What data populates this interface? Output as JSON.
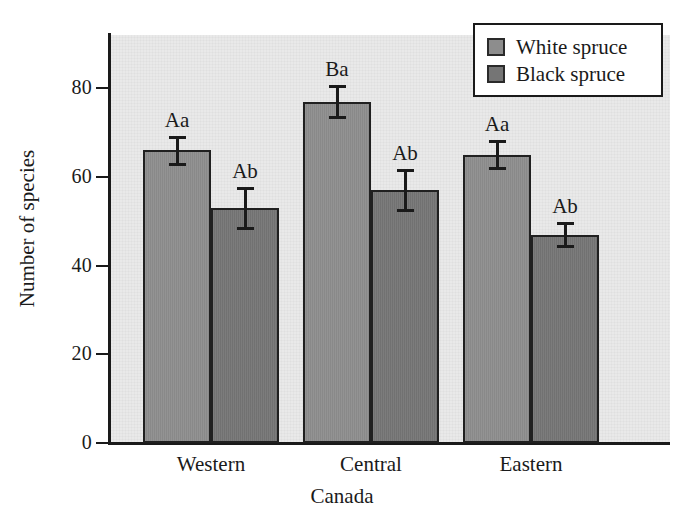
{
  "chart_data": {
    "type": "bar",
    "title": "",
    "subtitle": "",
    "xlabel": "Canada",
    "ylabel": "Number of species",
    "categories": [
      "Western",
      "Central",
      "Eastern"
    ],
    "ylim": [
      0,
      92
    ],
    "yticks": [
      0,
      20,
      40,
      60,
      80
    ],
    "ytick_labels": [
      "0",
      "20",
      "40",
      "60",
      "80"
    ],
    "grid": false,
    "legend_position": "top-right",
    "series": [
      {
        "name": "White spruce",
        "color": "#8d8d8d",
        "values": [
          66,
          77,
          65
        ],
        "errors": [
          3.0,
          3.5,
          3.0
        ],
        "annotations": [
          "Aa",
          "Ba",
          "Aa"
        ]
      },
      {
        "name": "Black spruce",
        "color": "#757575",
        "values": [
          53,
          57,
          47
        ],
        "errors": [
          4.5,
          4.5,
          2.5
        ],
        "annotations": [
          "Ab",
          "Ab",
          "Ab"
        ]
      }
    ]
  },
  "legend": {
    "items": [
      {
        "label": "White spruce",
        "swatch": "series-white"
      },
      {
        "label": "Black spruce",
        "swatch": "series-black"
      }
    ]
  },
  "axes": {
    "y_title": "Number of species",
    "x_title": "Canada",
    "y_tick_labels": [
      "80",
      "60",
      "40",
      "20",
      "0"
    ],
    "x_tick_labels": [
      "Western",
      "Central",
      "Eastern"
    ]
  },
  "colors": {
    "plot_background": "#e9e9e9",
    "page_background": "#ffffff",
    "axis": "#1a1a1a",
    "white_spruce": "#8d8d8d",
    "black_spruce": "#757575"
  }
}
